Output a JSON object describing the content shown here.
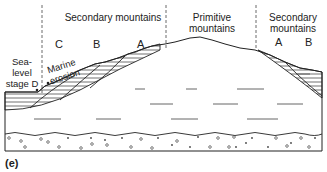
{
  "figure": {
    "panel_label": "(e)",
    "regions": {
      "secondary_left": "Secondary mountains",
      "primitive": "Primitive mountains",
      "secondary_right": "Secondary mountains"
    },
    "strata_letters": {
      "left_c": "C",
      "left_b": "B",
      "left_a": "A",
      "right_a": "A",
      "right_b": "B"
    },
    "annotations": {
      "sea_level": "Sea-level stage D",
      "marine_erosion": "Marine erosion"
    }
  }
}
